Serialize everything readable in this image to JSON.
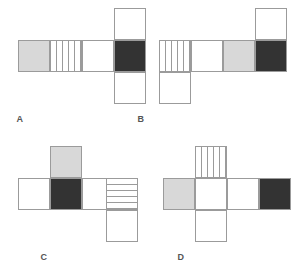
{
  "page": {
    "background": "#ffffff",
    "width": 297,
    "height": 276
  },
  "palette": {
    "white": "#ffffff",
    "gray": "#d8d8d8",
    "dark": "#333333",
    "stroke": "#9b9b9b",
    "label_color": "#555555"
  },
  "legend": {
    "fills": [
      "white",
      "gray",
      "dark",
      "vertical-stripes",
      "horizontal-stripes"
    ]
  },
  "figures": [
    {
      "id": "A",
      "label": "A",
      "cells": [
        {
          "name": "cell-gray",
          "fill": "gray",
          "col": 0,
          "row": 1
        },
        {
          "name": "cell-vstripe",
          "fill": "vstripe",
          "col": 1,
          "row": 1
        },
        {
          "name": "cell-white",
          "fill": "white",
          "col": 2,
          "row": 1
        },
        {
          "name": "cell-dark",
          "fill": "dark",
          "col": 3,
          "row": 1
        },
        {
          "name": "cell-white-top",
          "fill": "white",
          "col": 3,
          "row": 0
        },
        {
          "name": "cell-white-bottom",
          "fill": "white",
          "col": 3,
          "row": 2
        }
      ]
    },
    {
      "id": "B",
      "label": "B",
      "cells": [
        {
          "name": "cell-vstripe",
          "fill": "vstripe",
          "col": 0,
          "row": 1
        },
        {
          "name": "cell-white",
          "fill": "white",
          "col": 1,
          "row": 1
        },
        {
          "name": "cell-gray",
          "fill": "gray",
          "col": 2,
          "row": 1
        },
        {
          "name": "cell-dark",
          "fill": "dark",
          "col": 3,
          "row": 1
        },
        {
          "name": "cell-white-bottom",
          "fill": "white",
          "col": 0,
          "row": 2
        },
        {
          "name": "cell-white-top",
          "fill": "white",
          "col": 3,
          "row": 0
        }
      ]
    },
    {
      "id": "C",
      "label": "C",
      "cells": [
        {
          "name": "cell-white-left",
          "fill": "white",
          "col": 0,
          "row": 1
        },
        {
          "name": "cell-dark",
          "fill": "dark",
          "col": 1,
          "row": 1
        },
        {
          "name": "cell-white-mid",
          "fill": "white",
          "col": 2,
          "row": 1
        },
        {
          "name": "cell-hstripe",
          "fill": "hstripe",
          "col": 3,
          "row": 1
        },
        {
          "name": "cell-gray-top",
          "fill": "gray",
          "col": 1,
          "row": 0
        },
        {
          "name": "cell-white-bottom",
          "fill": "white",
          "col": 3,
          "row": 2
        }
      ]
    },
    {
      "id": "D",
      "label": "D",
      "cells": [
        {
          "name": "cell-gray",
          "fill": "gray",
          "col": 0,
          "row": 1
        },
        {
          "name": "cell-white-center",
          "fill": "white",
          "col": 1,
          "row": 1
        },
        {
          "name": "cell-white-right",
          "fill": "white",
          "col": 2,
          "row": 1
        },
        {
          "name": "cell-dark",
          "fill": "dark",
          "col": 3,
          "row": 1
        },
        {
          "name": "cell-vstripe-top",
          "fill": "vstripe",
          "col": 1,
          "row": 0
        },
        {
          "name": "cell-white-bottom",
          "fill": "white",
          "col": 1,
          "row": 2
        }
      ]
    }
  ]
}
